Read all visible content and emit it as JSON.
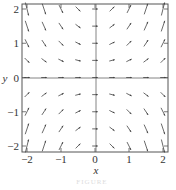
{
  "chart_data": {
    "type": "vector-field",
    "title": "",
    "xlabel": "x",
    "ylabel": "y",
    "xlim": [
      -2,
      2
    ],
    "ylim": [
      -2,
      2
    ],
    "xticks": [
      "-2",
      "-1",
      "0",
      "1",
      "2"
    ],
    "yticks": [
      "-2",
      "-1",
      "0",
      "1",
      "2"
    ],
    "grid": false,
    "axes_lines": true,
    "field_description": "Direction field with arrows of slope proportional to x*y: steep downward in quadrants II and IV, steep upward in quadrants I and III, flat near the axes",
    "sample_points_x": [
      -2,
      -1.5,
      -1,
      -0.5,
      0,
      0.5,
      1,
      1.5,
      2
    ],
    "sample_points_y": [
      2,
      1.5,
      1,
      0.5,
      0,
      -0.5,
      -1,
      -1.5,
      -2
    ]
  },
  "caption": "FIGURE"
}
